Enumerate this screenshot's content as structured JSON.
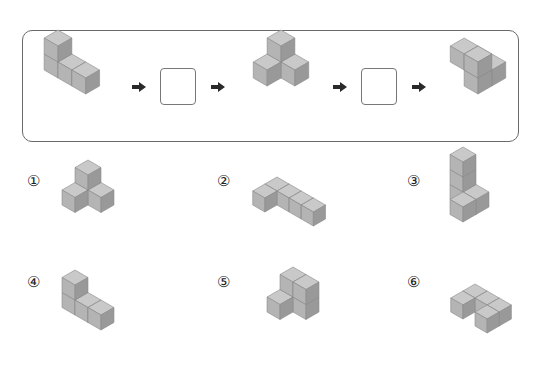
{
  "sequence": {
    "steps": [
      {
        "type": "figure",
        "name": "start-figure"
      },
      {
        "type": "arrow"
      },
      {
        "type": "blank"
      },
      {
        "type": "arrow"
      },
      {
        "type": "figure",
        "name": "middle-figure"
      },
      {
        "type": "arrow"
      },
      {
        "type": "blank"
      },
      {
        "type": "arrow"
      },
      {
        "type": "figure",
        "name": "end-figure"
      }
    ]
  },
  "options": [
    {
      "label": "①"
    },
    {
      "label": "②"
    },
    {
      "label": "③"
    },
    {
      "label": "④"
    },
    {
      "label": "⑤"
    },
    {
      "label": "⑥"
    }
  ],
  "colors": {
    "top": "#c9c9c9",
    "left": "#b4b4b4",
    "right": "#999999",
    "edge": "#8a8a8a",
    "arrow": "#2a2a2a",
    "border": "#6a6a6a"
  }
}
